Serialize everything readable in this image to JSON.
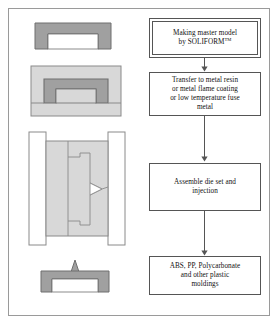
{
  "figure": {
    "type": "process-flow-diagram",
    "topic": "Rapid tooling injection molding process"
  },
  "flowchart": {
    "steps": [
      {
        "id": "step-1",
        "line1": "Making master model",
        "line2_prefix": "by SOLIFORM",
        "trademark": "TM",
        "style": "double-border"
      },
      {
        "id": "step-2",
        "line1": "Transfer to metal resin",
        "line2": "or metal flame coating",
        "line3": "or low temperature fuse",
        "line4": "metal",
        "style": "single-border"
      },
      {
        "id": "step-3",
        "line1": "Assemble die set and",
        "line2": "injection",
        "style": "single-border"
      },
      {
        "id": "step-4",
        "line1": "ABS, PP, Polycarbonate",
        "line2": "and other plastic",
        "line3": "moldings",
        "style": "single-border"
      }
    ],
    "connectors": [
      {
        "id": "arrow-1",
        "from": "step-1",
        "to": "step-2"
      },
      {
        "id": "arrow-2",
        "from": "step-2",
        "to": "step-3"
      },
      {
        "id": "arrow-3",
        "from": "step-3",
        "to": "step-4"
      }
    ]
  },
  "illustrations": [
    {
      "id": "illus-master-model",
      "caption": "Master model channel cross-section",
      "for_step": "step-1"
    },
    {
      "id": "illus-embedded-model",
      "caption": "Master model embedded in metal resin block",
      "for_step": "step-2"
    },
    {
      "id": "illus-die-set",
      "caption": "Assembled die set with cavity and injection gate",
      "for_step": "step-3"
    },
    {
      "id": "illus-molding",
      "caption": "Finished plastic molding with sprue",
      "for_step": "step-4"
    }
  ],
  "colors": {
    "frame_border": "#9a9a9a",
    "box_border": "#555555",
    "part_fill": "#a0a0a0",
    "part_stroke": "#6e6e6e",
    "block_fill": "#d8d8d8",
    "block_stroke": "#8a8a8a",
    "plate_fill": "#ffffff",
    "plate_stroke": "#8a8a8a",
    "text": "#111111",
    "page_background": "#ffffff"
  }
}
